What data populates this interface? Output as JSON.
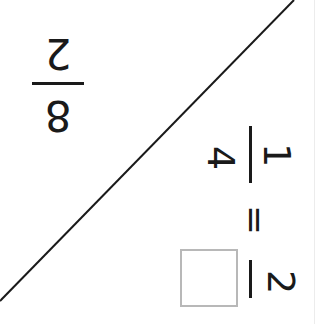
{
  "problem": {
    "left_fraction": {
      "numerator": "8",
      "denominator": "2"
    },
    "equation": {
      "fraction_one": {
        "numerator": "1",
        "denominator": "4"
      },
      "operator": "=",
      "fraction_two": {
        "numerator": "2",
        "denominator": ""
      }
    }
  },
  "colors": {
    "ink": "#1a1a1a",
    "background": "#ffffff",
    "box_border": "#b8b8b8"
  }
}
